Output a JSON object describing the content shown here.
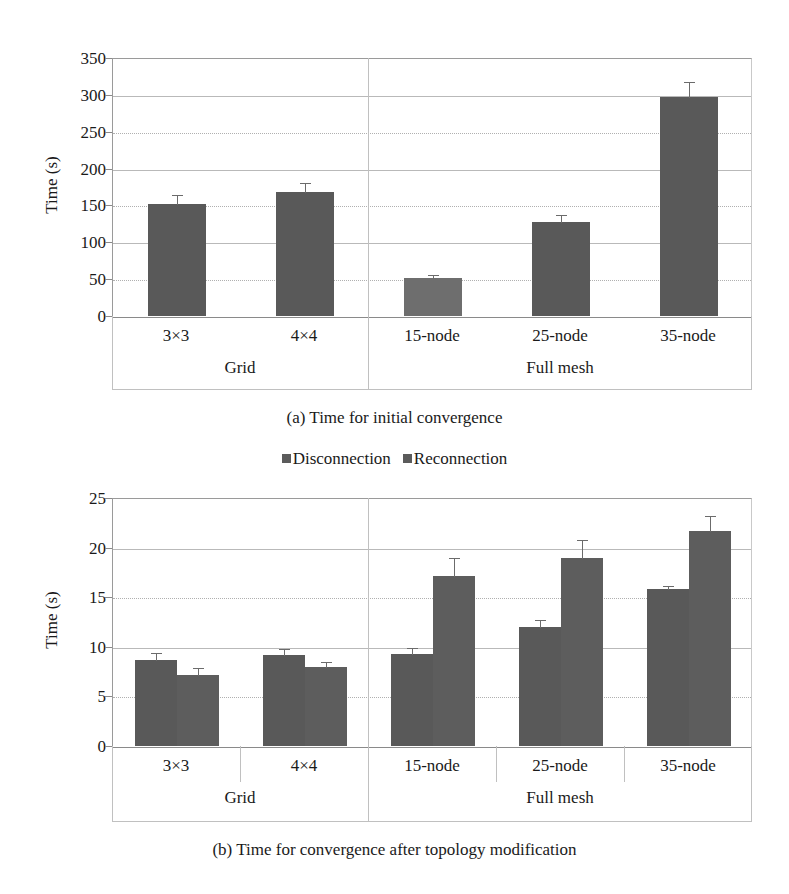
{
  "page": {
    "clipped_top_text": "",
    "background": "#ffffff"
  },
  "figure_a": {
    "caption": "(a) Time for initial convergence",
    "ylabel": "Time (s)"
  },
  "legend": {
    "items": [
      {
        "label": "Disconnection",
        "color": "#5b5b5b"
      },
      {
        "label": "Reconnection",
        "color": "#5b5b5b"
      }
    ]
  },
  "figure_b": {
    "caption": "(b) Time for convergence after topology modification",
    "ylabel": "Time (s)"
  },
  "groups": {
    "grid_label": "Grid",
    "mesh_label": "Full mesh"
  },
  "chart_data": [
    {
      "type": "bar",
      "id": "chart-a",
      "title": "(a) Time for initial convergence",
      "xlabel": "",
      "ylabel": "Time (s)",
      "ylim": [
        0,
        350
      ],
      "yticks": [
        0,
        50,
        100,
        150,
        200,
        250,
        300,
        350
      ],
      "ytick_labels": [
        "0",
        "50",
        "100",
        "150",
        "200",
        "250",
        "300",
        "350"
      ],
      "grid": true,
      "legend_position": "none",
      "categories": [
        "3×3",
        "4×4",
        "15-node",
        "25-node",
        "35-node"
      ],
      "category_groups": [
        {
          "label": "Grid",
          "categories": [
            "3×3",
            "4×4"
          ]
        },
        {
          "label": "Full mesh",
          "categories": [
            "15-node",
            "25-node",
            "35-node"
          ]
        }
      ],
      "series": [
        {
          "name": "Initial convergence",
          "color": "#595959",
          "values": [
            152,
            168,
            52,
            127,
            297
          ],
          "errors": [
            14,
            14,
            5,
            12,
            22
          ]
        }
      ]
    },
    {
      "type": "bar",
      "id": "chart-b",
      "title": "(b) Time for convergence after topology modification",
      "xlabel": "",
      "ylabel": "Time (s)",
      "ylim": [
        0,
        25
      ],
      "yticks": [
        0,
        5,
        10,
        15,
        20,
        25
      ],
      "ytick_labels": [
        "0",
        "5",
        "10",
        "15",
        "20",
        "25"
      ],
      "grid": true,
      "legend_position": "top",
      "categories": [
        "3×3",
        "4×4",
        "15-node",
        "25-node",
        "35-node"
      ],
      "category_groups": [
        {
          "label": "Grid",
          "categories": [
            "3×3",
            "4×4"
          ]
        },
        {
          "label": "Full mesh",
          "categories": [
            "15-node",
            "25-node",
            "35-node"
          ]
        }
      ],
      "series": [
        {
          "name": "Disconnection",
          "color": "#595959",
          "values": [
            8.7,
            9.2,
            9.3,
            12.0,
            15.8
          ],
          "errors": [
            0.8,
            0.7,
            0.7,
            0.8,
            0.4
          ]
        },
        {
          "name": "Reconnection",
          "color": "#5d5d5d",
          "values": [
            7.2,
            8.0,
            17.1,
            19.0,
            21.7
          ],
          "errors": [
            0.8,
            0.6,
            2.0,
            1.9,
            1.6
          ]
        }
      ]
    }
  ]
}
